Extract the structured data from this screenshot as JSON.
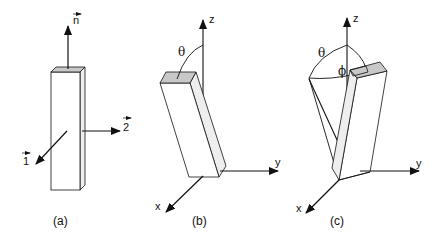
{
  "figure": {
    "panels": [
      {
        "id": "a",
        "caption": "(a)",
        "vectors": [
          {
            "symbol": "n",
            "has_arrow_over": true,
            "direction": "up"
          },
          {
            "symbol": "2",
            "has_arrow_over": true,
            "direction": "right"
          },
          {
            "symbol": "1",
            "has_arrow_over": true,
            "direction": "down-left"
          }
        ]
      },
      {
        "id": "b",
        "caption": "(b)",
        "axes": [
          "z",
          "y",
          "x"
        ],
        "angles": [
          "θ"
        ]
      },
      {
        "id": "c",
        "caption": "(c)",
        "axes": [
          "z",
          "y",
          "x"
        ],
        "angles": [
          "θ",
          "ϕ"
        ]
      }
    ],
    "colors": {
      "stroke": "#111111",
      "top_face": "#c8c8c8",
      "side_face": "#eeeeee",
      "background": "#ffffff"
    }
  }
}
